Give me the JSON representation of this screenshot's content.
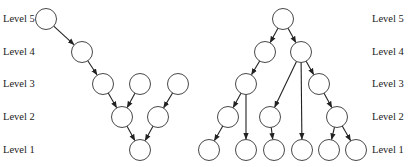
{
  "left_tree": {
    "labels": [
      "Level 5",
      "Level 4",
      "Level 3",
      "Level 2",
      "Level 1"
    ],
    "nodes": [
      {
        "id": "a5",
        "level": 5,
        "x": 46,
        "y": 19
      },
      {
        "id": "a4",
        "level": 4,
        "x": 82,
        "y": 52
      },
      {
        "id": "a3a",
        "level": 3,
        "x": 103,
        "y": 84
      },
      {
        "id": "a3b",
        "level": 3,
        "x": 140,
        "y": 84
      },
      {
        "id": "a3c",
        "level": 3,
        "x": 178,
        "y": 84
      },
      {
        "id": "a2a",
        "level": 2,
        "x": 122,
        "y": 117
      },
      {
        "id": "a2b",
        "level": 2,
        "x": 158,
        "y": 117
      },
      {
        "id": "a1",
        "level": 1,
        "x": 140,
        "y": 150
      }
    ],
    "edges": [
      [
        "a5",
        "a4"
      ],
      [
        "a4",
        "a3a"
      ],
      [
        "a3a",
        "a2a"
      ],
      [
        "a3b",
        "a2a"
      ],
      [
        "a3c",
        "a2b"
      ],
      [
        "a2a",
        "a1"
      ],
      [
        "a2b",
        "a1"
      ]
    ]
  },
  "right_tree": {
    "labels": [
      "Level 5",
      "Level 4",
      "Level 3",
      "Level 2",
      "Level 1"
    ],
    "nodes": [
      {
        "id": "b5",
        "level": 5,
        "x": 283,
        "y": 19
      },
      {
        "id": "b4a",
        "level": 4,
        "x": 265,
        "y": 52
      },
      {
        "id": "b4b",
        "level": 4,
        "x": 301,
        "y": 52
      },
      {
        "id": "b3a",
        "level": 3,
        "x": 246,
        "y": 84
      },
      {
        "id": "b3b",
        "level": 3,
        "x": 319,
        "y": 84
      },
      {
        "id": "b2a",
        "level": 2,
        "x": 228,
        "y": 117
      },
      {
        "id": "b2b",
        "level": 2,
        "x": 270,
        "y": 117
      },
      {
        "id": "b2c",
        "level": 2,
        "x": 337,
        "y": 117
      },
      {
        "id": "b1a",
        "level": 1,
        "x": 209,
        "y": 150
      },
      {
        "id": "b1b",
        "level": 1,
        "x": 246,
        "y": 150
      },
      {
        "id": "b1c",
        "level": 1,
        "x": 274,
        "y": 150
      },
      {
        "id": "b1d",
        "level": 1,
        "x": 302,
        "y": 150
      },
      {
        "id": "b1e",
        "level": 1,
        "x": 329,
        "y": 150
      },
      {
        "id": "b1f",
        "level": 1,
        "x": 356,
        "y": 150
      }
    ],
    "edges": [
      [
        "b5",
        "b4a"
      ],
      [
        "b5",
        "b4b"
      ],
      [
        "b4a",
        "b3a"
      ],
      [
        "b4b",
        "b3b"
      ],
      [
        "b4b",
        "b2b"
      ],
      [
        "b4b",
        "b1d"
      ],
      [
        "b3a",
        "b2a"
      ],
      [
        "b3a",
        "b1b"
      ],
      [
        "b3b",
        "b2c"
      ],
      [
        "b2a",
        "b1a"
      ],
      [
        "b2b",
        "b1c"
      ],
      [
        "b2c",
        "b1e"
      ],
      [
        "b2c",
        "b1f"
      ]
    ]
  }
}
